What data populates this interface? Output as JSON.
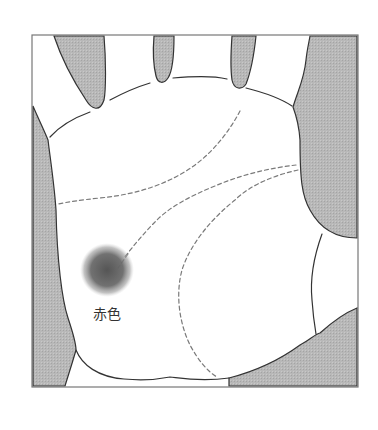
{
  "diagram": {
    "colors": {
      "background": "#ffffff",
      "frame_stroke": "#777777",
      "shade_fill": "#b4b4b4",
      "outline_stroke": "#333333",
      "dashed_line": "#777777",
      "spot": "#5a5a5a"
    },
    "elements": {
      "spot": {
        "label": "赤色",
        "description": "red-colored spot marker at end of dashed line"
      }
    }
  }
}
